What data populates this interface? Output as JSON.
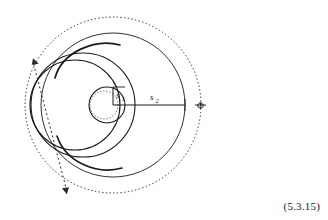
{
  "figure": {
    "equation_number": "(5.3.15)",
    "labels": {
      "s1_base": "s",
      "s1_sub": "1",
      "s2_base": "s",
      "s2_sub": "2",
      "phi": "Φ"
    },
    "colors": {
      "stroke": "#1a1a1a",
      "background": "#ffffff"
    },
    "geometry": {
      "center": {
        "x": 113,
        "y": 105
      },
      "outer_dotted_circle_radius": 88,
      "big_circle_radius": 72,
      "mid_circle": {
        "cx": 75,
        "cy": 105,
        "r": 45
      },
      "small_circle": {
        "cx": 107,
        "cy": 105,
        "r": 18
      },
      "small_dotted_circle": {
        "cx": 104,
        "cy": 105,
        "r": 14
      },
      "s1_length": 18,
      "s2_length": 72,
      "dashed_axis_angle_deg": 62
    }
  }
}
